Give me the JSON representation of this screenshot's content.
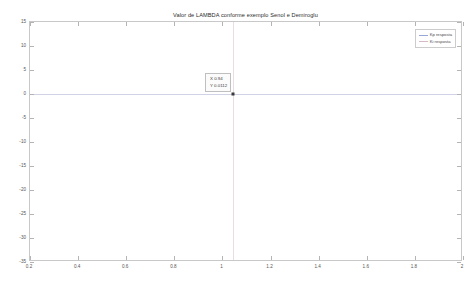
{
  "figure": {
    "title": "Valor de LAMBDA conforme exemplo Senol e Demiroglu"
  },
  "legend": {
    "entries": [
      {
        "label": "Kp resposta",
        "color": "#9aa7d6"
      },
      {
        "label": "Ki resposta",
        "color": "#d4b9c8"
      }
    ]
  },
  "datatip": {
    "x_label": "X 0.94",
    "y_label": "Y 0.0112",
    "x_value": 0.94,
    "y_value": 0.0112
  },
  "chart_data": {
    "type": "line",
    "title": "Valor de LAMBDA conforme exemplo Senol e Demiroglu",
    "xlabel": "",
    "ylabel": "",
    "xlim": [
      0.2,
      2
    ],
    "ylim": [
      -35,
      15
    ],
    "grid": false,
    "legend_position": "top-right",
    "xticks": [
      0.2,
      0.4,
      0.6,
      0.8,
      1,
      1.2,
      1.4,
      1.6,
      1.8,
      2
    ],
    "xticklabels": [
      "0.2",
      "0.4",
      "0.6",
      "0.8",
      "1",
      "1.2",
      "1.4",
      "1.6",
      "1.8",
      "2"
    ],
    "yticks": [
      15,
      10,
      5,
      0,
      -5,
      -10,
      -15,
      -20,
      -25,
      -30,
      -35
    ],
    "yticklabels": [
      "15",
      "10",
      "5",
      "0",
      "-5",
      "-10",
      "-15",
      "-20",
      "-25",
      "-30",
      "-35"
    ],
    "series": [
      {
        "name": "Kp resposta",
        "color": "#9aa7d6",
        "x": [
          0.2,
          0.4,
          0.6,
          0.8,
          0.94,
          1.0,
          1.2,
          1.4,
          1.6,
          1.8,
          2.0
        ],
        "values": [
          0.0112,
          0.0112,
          0.0112,
          0.0112,
          0.0112,
          0.0112,
          0.0112,
          0.0112,
          0.0112,
          0.0112,
          0.0112
        ]
      },
      {
        "name": "Ki resposta",
        "color": "#d4b9c8",
        "x": [
          0.94,
          0.94
        ],
        "values": [
          15,
          -35
        ]
      }
    ],
    "annotations": [
      {
        "text": "X 0.94",
        "x": 0.94,
        "y": 0.0112
      },
      {
        "text": "Y 0.0112",
        "x": 0.94,
        "y": 0.0112
      }
    ]
  }
}
